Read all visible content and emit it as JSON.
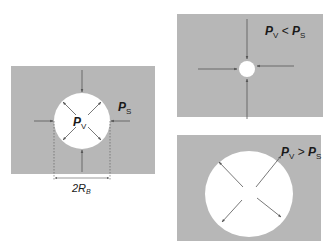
{
  "colors": {
    "panel_fill": "#b7b7b7",
    "bubble_fill": "#ffffff",
    "arrow_color": "#555555",
    "text_color": "#1a1a1a"
  },
  "panels": [
    {
      "id": "equilibrium",
      "labels": {
        "inner_pressure_main": "P",
        "inner_pressure_sub": "V",
        "outer_pressure_main": "P",
        "outer_pressure_sub": "S",
        "diameter_prefix": "2R",
        "diameter_sub": "B"
      },
      "arrows_inward": 4,
      "arrows_outward": 4
    },
    {
      "id": "shrinking",
      "labels": {
        "left_main": "P",
        "left_sub": "V",
        "operator": " < ",
        "right_main": "P",
        "right_sub": "S"
      },
      "arrows_inward": 4
    },
    {
      "id": "expanding",
      "labels": {
        "left_main": "P",
        "left_sub": "V",
        "operator": " > ",
        "right_main": "P",
        "right_sub": "S"
      },
      "arrows_outward": 4
    }
  ]
}
